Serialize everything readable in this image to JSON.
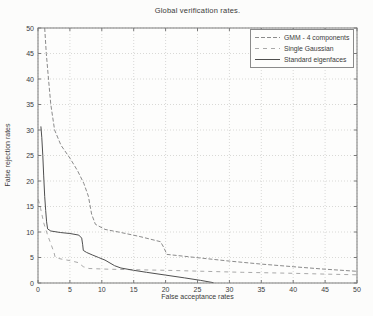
{
  "chart_data": {
    "type": "line",
    "title": "Global verification rates.",
    "xlabel": "False acceptance rates",
    "ylabel": "False rejection rates",
    "xlim": [
      0,
      50
    ],
    "ylim": [
      0,
      50
    ],
    "xticks": [
      0,
      5,
      10,
      15,
      20,
      25,
      30,
      35,
      40,
      45,
      50
    ],
    "yticks": [
      0,
      5,
      10,
      15,
      20,
      25,
      30,
      35,
      40,
      45,
      50
    ],
    "grid": true,
    "legend_position": "top-right",
    "colors": {
      "axis": "#7a7a7a",
      "grid": "#c9c9c6",
      "text": "#3b3b3b",
      "plot_background": "#fdfdfc"
    },
    "series": [
      {
        "name": "GMM - 4 components",
        "style": "dashed",
        "color": "#8b8b8b",
        "dash": "4,2",
        "points": [
          [
            1.05,
            50
          ],
          [
            1.3,
            45
          ],
          [
            1.65,
            40
          ],
          [
            2.0,
            35
          ],
          [
            2.6,
            30
          ],
          [
            3.6,
            27
          ],
          [
            5.0,
            24.5
          ],
          [
            6.2,
            22
          ],
          [
            7.2,
            19.5
          ],
          [
            7.9,
            17
          ],
          [
            8.4,
            13.5
          ],
          [
            9.0,
            11.5
          ],
          [
            10.5,
            10.5
          ],
          [
            13,
            9.9
          ],
          [
            16,
            9.1
          ],
          [
            19.2,
            8.1
          ],
          [
            19.7,
            7.0
          ],
          [
            20.2,
            5.6
          ],
          [
            24,
            5.1
          ],
          [
            30,
            4.3
          ],
          [
            35,
            3.7
          ],
          [
            40,
            3.2
          ],
          [
            45,
            2.7
          ],
          [
            50,
            2.3
          ]
        ]
      },
      {
        "name": "Single Gaussian",
        "style": "dashed",
        "color": "#a9a9a9",
        "dash": "4,4",
        "points": [
          [
            0.05,
            16.4
          ],
          [
            0.4,
            14.6
          ],
          [
            0.9,
            11.8
          ],
          [
            1.5,
            9.4
          ],
          [
            2.1,
            7.4
          ],
          [
            2.5,
            6.0
          ],
          [
            2.7,
            5.0
          ],
          [
            3.6,
            4.7
          ],
          [
            5.0,
            4.4
          ],
          [
            6.3,
            4.0
          ],
          [
            7.1,
            3.2
          ],
          [
            8.0,
            2.85
          ],
          [
            11,
            2.7
          ],
          [
            15,
            2.6
          ],
          [
            20,
            2.5
          ],
          [
            26,
            2.3
          ],
          [
            32,
            2.1
          ],
          [
            40,
            1.9
          ],
          [
            45,
            1.75
          ],
          [
            50,
            1.6
          ]
        ]
      },
      {
        "name": "Standard eigenfaces",
        "style": "solid",
        "color": "#4f4f4f",
        "dash": "",
        "points": [
          [
            0.45,
            30.7
          ],
          [
            0.6,
            28.5
          ],
          [
            0.75,
            25
          ],
          [
            0.9,
            21
          ],
          [
            1.05,
            17
          ],
          [
            1.2,
            14.2
          ],
          [
            1.35,
            12
          ],
          [
            1.5,
            10.6
          ],
          [
            2.0,
            10.2
          ],
          [
            3.5,
            9.9
          ],
          [
            5.0,
            9.7
          ],
          [
            6.4,
            9.4
          ],
          [
            6.85,
            8.8
          ],
          [
            7.0,
            7.5
          ],
          [
            7.1,
            6.4
          ],
          [
            7.6,
            6.0
          ],
          [
            8.5,
            5.5
          ],
          [
            9.5,
            5.0
          ],
          [
            10.5,
            4.5
          ],
          [
            12,
            3.4
          ],
          [
            13,
            2.95
          ],
          [
            15,
            2.5
          ],
          [
            17,
            2.1
          ],
          [
            20,
            1.55
          ],
          [
            23,
            1.0
          ],
          [
            25.5,
            0.5
          ],
          [
            27.5,
            0.05
          ]
        ]
      }
    ]
  }
}
